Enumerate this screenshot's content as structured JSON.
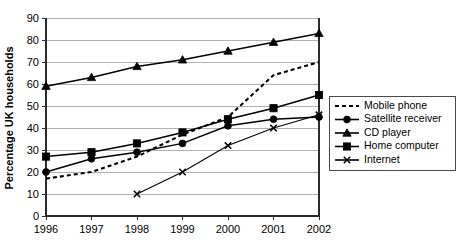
{
  "chart_data": {
    "type": "line",
    "title": "",
    "xlabel": "",
    "ylabel": "Percentage UK households",
    "x": [
      1996,
      1997,
      1998,
      1999,
      2000,
      2001,
      2002
    ],
    "categories": [
      "1996",
      "1997",
      "1998",
      "1999",
      "2000",
      "2001",
      "2002"
    ],
    "xlim": [
      1996,
      2002
    ],
    "ylim": [
      0,
      90
    ],
    "yticks": [
      0,
      10,
      20,
      30,
      40,
      50,
      60,
      70,
      80,
      90
    ],
    "ytick_labels": [
      "0",
      "10",
      "20",
      "30",
      "40",
      "50",
      "60",
      "70",
      "80",
      "90"
    ],
    "grid": true,
    "legend_position": "right",
    "series": [
      {
        "name": "Mobile phone",
        "marker": "none",
        "line_style": "dashed",
        "x": [
          1996,
          1997,
          1998,
          1999,
          2000,
          2001,
          2002
        ],
        "values": [
          17,
          20,
          27,
          37,
          45,
          64,
          70
        ]
      },
      {
        "name": "Satellite receiver",
        "marker": "circle",
        "line_style": "solid",
        "x": [
          1996,
          1997,
          1998,
          1999,
          2000,
          2001,
          2002
        ],
        "values": [
          20,
          26,
          29,
          33,
          41,
          44,
          45
        ]
      },
      {
        "name": "CD player",
        "marker": "triangle",
        "line_style": "solid",
        "x": [
          1996,
          1997,
          1998,
          1999,
          2000,
          2001,
          2002
        ],
        "values": [
          59,
          63,
          68,
          71,
          75,
          79,
          83
        ]
      },
      {
        "name": "Home computer",
        "marker": "square",
        "line_style": "solid",
        "x": [
          1996,
          1997,
          1998,
          1999,
          2000,
          2001,
          2002
        ],
        "values": [
          27,
          29,
          33,
          38,
          44,
          49,
          55
        ]
      },
      {
        "name": "Internet",
        "marker": "x",
        "line_style": "solid-thin",
        "x": [
          1998,
          1999,
          2000,
          2001,
          2002
        ],
        "values": [
          10,
          20,
          32,
          40,
          46
        ]
      }
    ]
  },
  "legend": {
    "items": [
      {
        "label": "Mobile phone"
      },
      {
        "label": "Satellite receiver"
      },
      {
        "label": "CD player"
      },
      {
        "label": "Home computer"
      },
      {
        "label": "Internet"
      }
    ]
  }
}
